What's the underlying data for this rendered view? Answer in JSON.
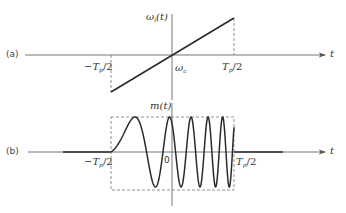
{
  "figure": {
    "panel_a": {
      "tag": "(a)",
      "y_axis_label": {
        "sym": "ω",
        "sub": "i",
        "arg": "(t)"
      },
      "x_axis_label": "t",
      "origin_label": {
        "sym": "ω",
        "sub": "c"
      },
      "left_tick": {
        "pre": "−T",
        "sub": "p",
        "post": "/2"
      },
      "right_tick": {
        "pre": "T",
        "sub": "p",
        "post": "/2"
      },
      "description": "Instantaneous frequency rises linearly from −Tp/2 to Tp/2, passing through ωc at t=0"
    },
    "panel_b": {
      "tag": "(b)",
      "y_axis_label": "m(t)",
      "x_axis_label": "t",
      "origin_label": "0",
      "left_tick": {
        "pre": "−T",
        "sub": "p",
        "post": "/2"
      },
      "right_tick": {
        "pre": "T",
        "sub": "p",
        "post": "/2"
      },
      "description": "Linear FM chirp pulse confined to a dashed rectangular envelope between −Tp/2 and Tp/2"
    },
    "colors": {
      "line": "#2a2a2a",
      "axis": "#555555",
      "dash": "#666666",
      "background": "#ffffff"
    }
  }
}
